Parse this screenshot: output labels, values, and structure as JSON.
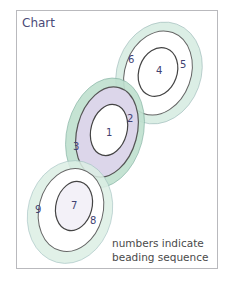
{
  "title": "Chart",
  "caption": {
    "line1": "numbers indicate",
    "line2": "beading sequence"
  },
  "labels": [
    "1",
    "2",
    "3",
    "4",
    "5",
    "6",
    "7",
    "8",
    "9"
  ],
  "colors": {
    "outer_ring_fill": "#d3ebdf",
    "middle_ring_fill": "#dcd6ea",
    "outline": "#5a5a5a",
    "number": "#3f4272",
    "frame": "#b9b9bd"
  }
}
